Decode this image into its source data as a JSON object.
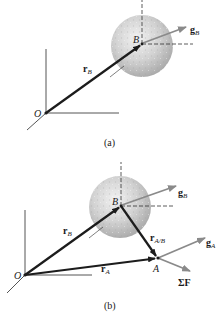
{
  "figure_a": {
    "caption": "(a)",
    "origin_label": "O",
    "point_b_label": "B",
    "position_vector": {
      "symbol": "r",
      "subscript": "B"
    },
    "gravity_vector": {
      "symbol": "g",
      "subscript": "B"
    }
  },
  "figure_b": {
    "caption": "(b)",
    "origin_label": "O",
    "point_b_label": "B",
    "point_a_label": "A",
    "position_vector_b": {
      "symbol": "r",
      "subscript": "B"
    },
    "position_vector_a": {
      "symbol": "r",
      "subscript": "A"
    },
    "relative_vector": {
      "symbol": "r",
      "subscript": "A/B"
    },
    "gravity_vector_b": {
      "symbol": "g",
      "subscript": "B"
    },
    "gravity_vector_a": {
      "symbol": "g",
      "subscript": "A"
    },
    "net_force": {
      "symbol": "ΣF"
    }
  },
  "colors": {
    "vector_dark": "#1c1c1c",
    "vector_gray": "#8a8a8a",
    "axis": "#2a2a2a",
    "sphere_light": "#e6e6e6",
    "sphere_dark": "#a8a8a8"
  }
}
